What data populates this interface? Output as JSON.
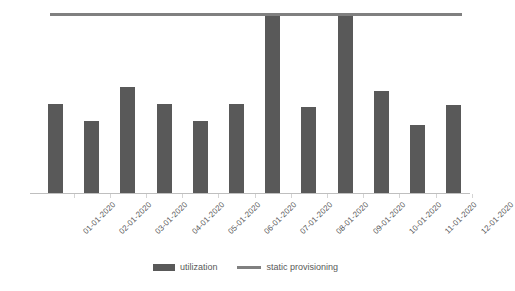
{
  "chart_data": {
    "type": "bar",
    "title": "",
    "subtitle": "",
    "xlabel": "",
    "ylabel": "",
    "ylim": [
      0,
      110
    ],
    "grid": false,
    "legend_position": "bottom-center",
    "categories": [
      "01-01-2020",
      "02-01-2020",
      "03-01-2020",
      "04-01-2020",
      "05-01-2020",
      "06-01-2020",
      "07-01-2020",
      "08-01-2020",
      "09-01-2020",
      "10-01-2020",
      "11-01-2020",
      "12-01-2020"
    ],
    "series": [
      {
        "name": "utilization",
        "type": "bar",
        "color": "#595959",
        "values": [
          50,
          40,
          59,
          50,
          40,
          50,
          100,
          48,
          100,
          57,
          38,
          49
        ]
      },
      {
        "name": "static provisioning",
        "type": "line",
        "color": "#808080",
        "values": [
          100,
          100,
          100,
          100,
          100,
          100,
          100,
          100,
          100,
          100,
          100,
          100
        ]
      }
    ],
    "annotations": []
  },
  "legend": {
    "items": [
      {
        "label": "utilization",
        "marker": "bar-swatch",
        "color": "#595959"
      },
      {
        "label": "static provisioning",
        "marker": "line-swatch",
        "color": "#808080"
      }
    ]
  },
  "axes": {
    "x_tick_labels": [
      "01-01-2020",
      "02-01-2020",
      "03-01-2020",
      "04-01-2020",
      "05-01-2020",
      "06-01-2020",
      "07-01-2020",
      "08-01-2020",
      "09-01-2020",
      "10-01-2020",
      "11-01-2020",
      "12-01-2020"
    ],
    "y_tick_labels": [],
    "axis_color": "#bfbfbf",
    "label_color": "#595959"
  },
  "colors": {
    "background": "#ffffff",
    "bar": "#595959",
    "line": "#808080",
    "axis": "#bfbfbf",
    "text": "#595959"
  }
}
